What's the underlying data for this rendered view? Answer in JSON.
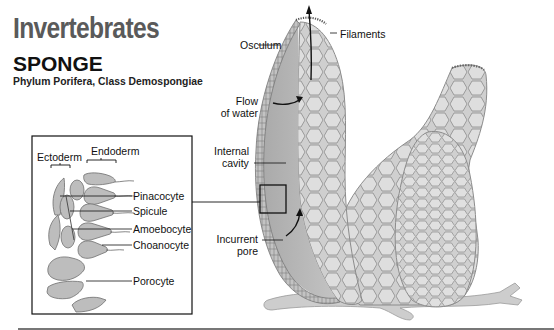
{
  "header": {
    "title": "Invertebrates",
    "subtitle": "SPONGE",
    "classification": "Phylum Porifera, Class Demospongiae"
  },
  "inset": {
    "layer_labels": {
      "ectoderm": "Ectoderm",
      "endoderm": "Endoderm"
    },
    "cell_labels": [
      {
        "label": "Pinacocyte"
      },
      {
        "label": "Spicule"
      },
      {
        "label": "Amoebocyte"
      },
      {
        "label": "Choanocyte"
      },
      {
        "label": "Porocyte"
      }
    ]
  },
  "main_labels": {
    "osculum": "Osculum",
    "filaments": "Filaments",
    "flow_of_water_line1": "Flow",
    "flow_of_water_line2": "of water",
    "internal_cavity_line1": "Internal",
    "internal_cavity_line2": "cavity",
    "incurrent_pore_line1": "Incurrent",
    "incurrent_pore_line2": "pore"
  },
  "colors": {
    "title_gray": "#5a5a5a",
    "sponge_fill": "#c9c9c9",
    "sponge_dark": "#a8a8a8",
    "cavity_fill": "#b5b5b5",
    "cell_outline": "#888888"
  }
}
